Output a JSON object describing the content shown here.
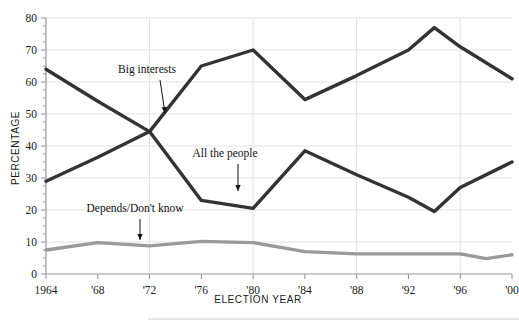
{
  "chart_data": {
    "type": "line",
    "title": "",
    "xlabel": "ELECTION YEAR",
    "ylabel": "PERCENTAGE",
    "ylim": [
      0,
      80
    ],
    "xlim": [
      1964,
      2000
    ],
    "ytick_step": 10,
    "yticks": [
      0,
      10,
      20,
      30,
      40,
      50,
      60,
      70,
      80
    ],
    "ytick_labels": [
      "0",
      "10",
      "20",
      "30",
      "40",
      "50",
      "60",
      "70",
      "80"
    ],
    "minor_ytick_step": 2.5,
    "x": [
      1964,
      1966,
      1968,
      1970,
      1972,
      1974,
      1976,
      1978,
      1980,
      1982,
      1984,
      1986,
      1988,
      1990,
      1992,
      1994,
      1996,
      1998,
      2000
    ],
    "xticks": [
      1964,
      1968,
      1972,
      1976,
      1980,
      1984,
      1988,
      1992,
      1996,
      2000
    ],
    "xtick_labels": [
      "1964",
      "'68",
      "'72",
      "'76",
      "'80",
      "'84",
      "'88",
      "'92",
      "'96",
      "'00"
    ],
    "grid": "both-major",
    "gridlines_x": [
      1972,
      1980,
      1988,
      1996
    ],
    "gridlines_y": [
      10,
      20,
      30,
      40,
      50,
      60,
      70,
      80
    ],
    "legend": "annotations-inline",
    "series": [
      {
        "name": "Big interests",
        "color": "#333333",
        "width": 3.4,
        "x": [
          1964,
          1968,
          1972,
          1976,
          1980,
          1984,
          1988,
          1992,
          1994,
          1996,
          2000
        ],
        "values": [
          64,
          54,
          44.5,
          65,
          70,
          54.5,
          62,
          70,
          77,
          71,
          61
        ]
      },
      {
        "name": "All the people",
        "color": "#333333",
        "width": 3.4,
        "x": [
          1964,
          1968,
          1972,
          1976,
          1980,
          1984,
          1988,
          1992,
          1994,
          1996,
          2000
        ],
        "values": [
          29,
          36.5,
          44.5,
          23,
          20.5,
          38.5,
          31,
          24,
          19.5,
          27,
          35
        ]
      },
      {
        "name": "Depends/Don't know",
        "color": "#9a9a9a",
        "width": 3.4,
        "x": [
          1964,
          1968,
          1972,
          1976,
          1980,
          1984,
          1988,
          1992,
          1996,
          1998,
          2000
        ],
        "values": [
          7.5,
          9.8,
          8.8,
          10.2,
          9.8,
          7,
          6.3,
          6.3,
          6.3,
          4.8,
          6
        ]
      }
    ],
    "annotations": [
      {
        "label": "Big interests",
        "text_x": 147,
        "text_y": 73,
        "arrow_from_x": 160,
        "arrow_from_y": 80,
        "arrow_to_x": 165,
        "arrow_to_y": 113
      },
      {
        "label": "All the people",
        "text_x": 225,
        "text_y": 157,
        "arrow_from_x": 238,
        "arrow_from_y": 164,
        "arrow_to_x": 238,
        "arrow_to_y": 191
      },
      {
        "label": "Depends/Don't know",
        "text_x": 135,
        "text_y": 212,
        "arrow_from_x": 140,
        "arrow_from_y": 219,
        "arrow_to_x": 140,
        "arrow_to_y": 240
      }
    ]
  },
  "footer": {
    "divider_visible": "true"
  }
}
